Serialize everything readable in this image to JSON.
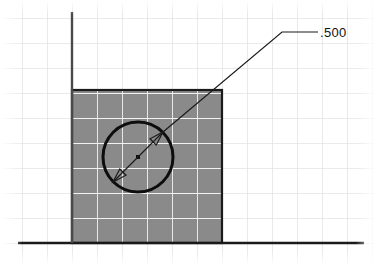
{
  "drawing": {
    "title": "Hole diameter dimension on square plate",
    "canvas": {
      "width": 378,
      "height": 265,
      "background": "#ffffff"
    },
    "grid": {
      "name": "graph-paper-grid",
      "spacing": 25,
      "origin_x": 72,
      "origin_y": 243,
      "line_color_outside": "#e3e3e3",
      "line_color_inside_plate": "#ffffff",
      "visible": true
    },
    "axes": {
      "horizontal": {
        "label": "horizontal-axis",
        "x1": 18,
        "y1": 243,
        "x2": 364,
        "y2": 243,
        "color": "#1a1a1a",
        "width": 2.6
      },
      "vertical": {
        "label": "vertical-axis",
        "x1": 72,
        "y1": 12,
        "x2": 72,
        "y2": 243,
        "color": "#4a4a4a",
        "width": 2.4
      }
    },
    "plate": {
      "name": "gray-square-plate",
      "x": 72,
      "y": 90,
      "width": 150,
      "height": 153,
      "fill": "#8a8a8a",
      "stroke": "#1a1a1a",
      "stroke_width": 2.2
    },
    "hole": {
      "name": "circle-hole",
      "center_x": 138,
      "center_y": 157,
      "radius": 35,
      "stroke": "#0d0d0d",
      "stroke_width": 3.0,
      "fill": "none",
      "center_mark": {
        "name": "center-point",
        "size": 4,
        "color": "#0d0d0d"
      }
    },
    "dimension": {
      "name": "diameter-dimension",
      "type": "diameter",
      "value": ".500",
      "arrow_style": "open",
      "line_color": "#1a1a1a",
      "line_width": 1.2,
      "start_x": 113,
      "start_y": 182,
      "end_x": 163,
      "end_y": 132,
      "leader": {
        "elbow_x": 282,
        "elbow_y": 32,
        "shelf_end_x": 318,
        "shelf_end_y": 32
      },
      "text_x": 320,
      "text_y": 37
    }
  }
}
